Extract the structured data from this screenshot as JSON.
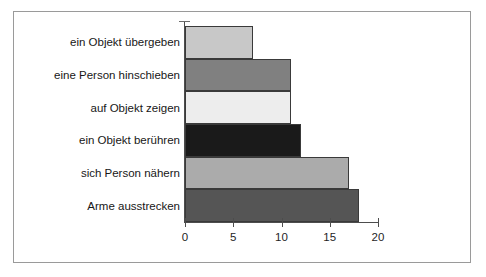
{
  "chart_data": {
    "type": "bar",
    "orientation": "horizontal",
    "title": "",
    "subtitle": "",
    "xlabel": "",
    "ylabel": "",
    "categories": [
      "ein Objekt übergeben",
      "eine Person hinschieben",
      "auf Objekt zeigen",
      "ein Objekt berühren",
      "sich Person nähern",
      "Arme ausstrecken"
    ],
    "values": [
      7,
      11,
      11,
      12,
      17,
      18
    ],
    "bar_colors": [
      "#c8c8c8",
      "#808080",
      "#ededed",
      "#1a1a1a",
      "#ababab",
      "#555555"
    ],
    "bar_border_color": "#3a3a3a",
    "xlim": [
      0,
      20
    ],
    "xticks": [
      0,
      5,
      10,
      15,
      20
    ],
    "xtick_labels": [
      "0",
      "5",
      "10",
      "15",
      "20"
    ],
    "grid": false,
    "legend": false,
    "legend_position": "none",
    "axis_color": "#4d4d4d",
    "frame_color": "#9a9a9a",
    "background": "#ffffff"
  }
}
